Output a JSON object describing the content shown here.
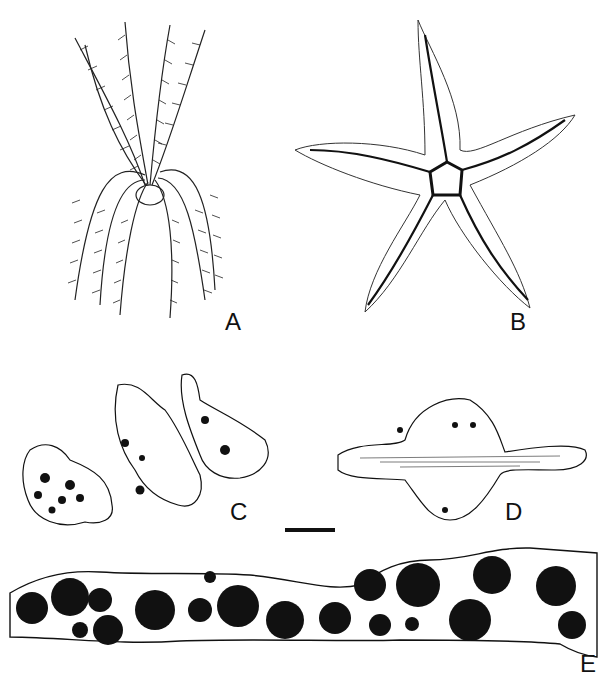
{
  "figure": {
    "panels": [
      {
        "id": "A",
        "label": "A",
        "subject": "crinoid (feather star) illustration"
      },
      {
        "id": "B",
        "label": "B",
        "subject": "starfish illustration"
      },
      {
        "id": "C",
        "label": "C",
        "subject": "three ossicle fragments with dark inclusions"
      },
      {
        "id": "D",
        "label": "D",
        "subject": "elongated ossicle section with striations"
      },
      {
        "id": "E",
        "label": "E",
        "subject": "long horizontal section with many dark round inclusions"
      }
    ],
    "scale_bar": {
      "visible": true
    }
  },
  "colors": {
    "ink": "#111111",
    "background": "#ffffff"
  }
}
